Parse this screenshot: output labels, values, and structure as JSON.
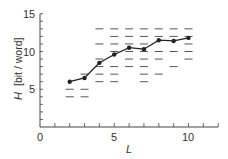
{
  "chart_data": {
    "type": "line",
    "title": "",
    "xlabel": "L",
    "ylabel": "H [bit / word]",
    "ylabel_symbol": "H",
    "ylabel_unit": "[bit / word]",
    "xlim": [
      0,
      12
    ],
    "ylim": [
      0,
      15
    ],
    "x_ticks": [
      0,
      5,
      10
    ],
    "y_ticks": [
      5,
      10,
      15
    ],
    "x_minor_step": 1,
    "y_minor_step": 1,
    "grid": false,
    "legend": null,
    "series": [
      {
        "name": "mean",
        "marker": "filled-circle",
        "x": [
          2,
          3,
          4,
          5,
          6,
          7,
          8,
          9,
          10
        ],
        "values": [
          6.0,
          6.5,
          8.5,
          9.6,
          10.5,
          10.3,
          11.5,
          11.4,
          11.8
        ]
      }
    ],
    "scatter_dashes": {
      "name": "individual values",
      "marker": "horizontal-dash",
      "columns": [
        {
          "x": 2,
          "y": [
            5,
            4
          ]
        },
        {
          "x": 3,
          "y": [
            7,
            5,
            4
          ]
        },
        {
          "x": 4,
          "y": [
            13,
            11,
            9,
            8,
            7,
            6
          ]
        },
        {
          "x": 5,
          "y": [
            13,
            12,
            11,
            10,
            8,
            7,
            6
          ]
        },
        {
          "x": 6,
          "y": [
            13,
            12,
            11,
            10,
            9,
            8
          ]
        },
        {
          "x": 7,
          "y": [
            13,
            12,
            11,
            10,
            9,
            8,
            7,
            6
          ]
        },
        {
          "x": 8,
          "y": [
            13,
            12,
            10,
            9,
            7
          ]
        },
        {
          "x": 9,
          "y": [
            13,
            12,
            10,
            8
          ]
        },
        {
          "x": 10,
          "y": [
            13,
            12,
            11,
            10,
            9
          ]
        }
      ]
    }
  },
  "axes": {
    "x_tick_labels": [
      "0",
      "5",
      "10"
    ],
    "y_tick_labels": [
      "5",
      "10",
      "15"
    ]
  },
  "colors": {
    "line": "#222222",
    "dash": "#555555",
    "axis": "#444444"
  }
}
